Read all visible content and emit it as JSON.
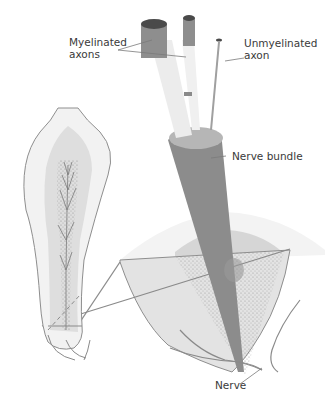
{
  "diagram": {
    "labels": {
      "myelinated": "Myelinated\naxons",
      "unmyelinated": "Unmyelinated\naxon",
      "nerve_bundle": "Nerve bundle",
      "nerve": "Nerve"
    },
    "colors": {
      "dark_axon": "#555555",
      "mid_axon": "#8a8a8a",
      "sheath": "#e6e6e6",
      "bundle": "#8c8c8c",
      "bundle_top": "#b4b4b4",
      "tooth_outline": "#8a8a8a",
      "tooth_fill": "#f1f1f1",
      "pulp_fill": "#dcdcdc",
      "section_fill": "#e3e3e3",
      "outer_cap": "#f2f2f2",
      "inner_cap": "#d4d4d4",
      "leader": "#7a7a7a"
    }
  }
}
